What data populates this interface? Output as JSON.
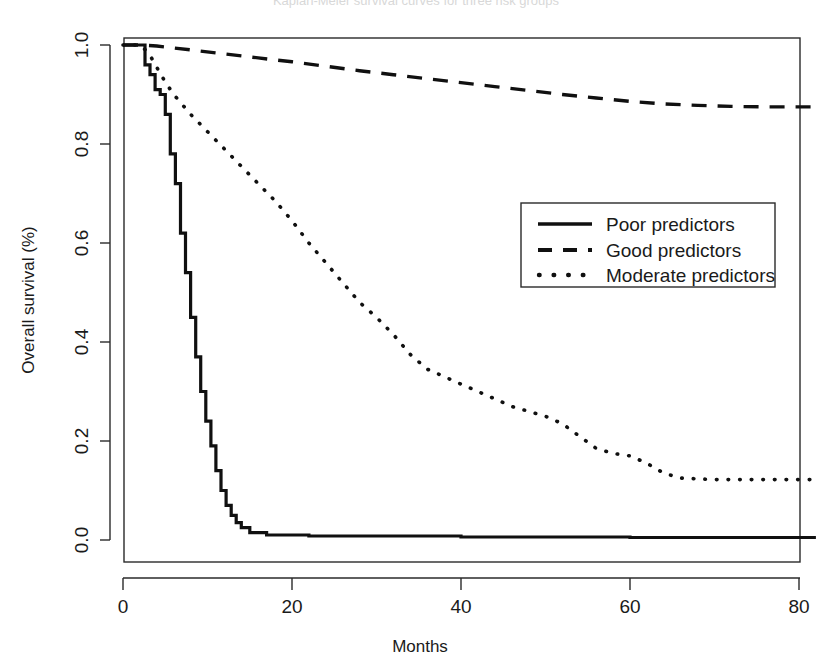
{
  "figure": {
    "title_partial": "Kaplan-Meier survival curves for three risk groups",
    "background": "#ffffff",
    "ink_color": "#101010"
  },
  "axes": {
    "x_label": "Months",
    "y_label": "Overall survival (%)",
    "x_ticks": [
      "0",
      "20",
      "40",
      "60",
      "80"
    ],
    "y_ticks": [
      "0.0",
      "0.2",
      "0.4",
      "0.6",
      "0.8",
      "1.0"
    ]
  },
  "legend": {
    "items": [
      {
        "label": "Poor predictors",
        "style": "solid"
      },
      {
        "label": "Good predictors",
        "style": "dashed"
      },
      {
        "label": "Moderate predictors",
        "style": "dotted"
      }
    ]
  },
  "chart_data": {
    "type": "line",
    "title": "Kaplan-Meier survival curves for three risk groups",
    "xlabel": "Months",
    "ylabel": "Overall survival (%)",
    "xlim": [
      0,
      84
    ],
    "ylim": [
      0.0,
      1.0
    ],
    "xticks": [
      0,
      20,
      40,
      60,
      80
    ],
    "yticks": [
      0.0,
      0.2,
      0.4,
      0.6,
      0.8,
      1.0
    ],
    "grid": false,
    "legend_position": "center-right",
    "series": [
      {
        "name": "Poor predictors",
        "style": "solid",
        "x": [
          0,
          1,
          2,
          2.6,
          3.2,
          3.8,
          4.4,
          5.0,
          5.6,
          6.2,
          6.8,
          7.4,
          8.0,
          8.6,
          9.2,
          9.8,
          10.4,
          11.0,
          11.6,
          12.2,
          12.8,
          13.4,
          14.0,
          15.0,
          17.0,
          22.0,
          40.0,
          60.0,
          82.0
        ],
        "y": [
          1.0,
          1.0,
          1.0,
          0.96,
          0.94,
          0.91,
          0.9,
          0.86,
          0.78,
          0.72,
          0.62,
          0.54,
          0.45,
          0.37,
          0.3,
          0.24,
          0.19,
          0.14,
          0.1,
          0.07,
          0.05,
          0.035,
          0.025,
          0.015,
          0.01,
          0.008,
          0.006,
          0.005,
          0.005
        ]
      },
      {
        "name": "Good predictors",
        "style": "dashed",
        "x": [
          0,
          2,
          4,
          8,
          12,
          16,
          20,
          24,
          28,
          32,
          36,
          40,
          44,
          48,
          52,
          56,
          60,
          64,
          68,
          72,
          76,
          80,
          82
        ],
        "y": [
          1.0,
          1.0,
          0.998,
          0.99,
          0.982,
          0.974,
          0.966,
          0.957,
          0.948,
          0.94,
          0.932,
          0.924,
          0.916,
          0.908,
          0.9,
          0.893,
          0.886,
          0.881,
          0.878,
          0.876,
          0.875,
          0.875,
          0.875
        ]
      },
      {
        "name": "Moderate predictors",
        "style": "dotted",
        "x": [
          0,
          2,
          3,
          4,
          5,
          6,
          8,
          10,
          12,
          14,
          16,
          18,
          20,
          22,
          24,
          26,
          28,
          30,
          32,
          34,
          36,
          38,
          40,
          42,
          44,
          46,
          48,
          50,
          52,
          54,
          56,
          58,
          60,
          62,
          64,
          66,
          70,
          74,
          78,
          82
        ],
        "y": [
          1.0,
          1.0,
          0.985,
          0.955,
          0.925,
          0.9,
          0.86,
          0.825,
          0.79,
          0.755,
          0.72,
          0.685,
          0.645,
          0.6,
          0.56,
          0.52,
          0.48,
          0.45,
          0.415,
          0.375,
          0.345,
          0.33,
          0.315,
          0.3,
          0.285,
          0.27,
          0.26,
          0.25,
          0.235,
          0.21,
          0.185,
          0.175,
          0.17,
          0.155,
          0.135,
          0.125,
          0.122,
          0.122,
          0.122,
          0.122
        ]
      }
    ]
  }
}
